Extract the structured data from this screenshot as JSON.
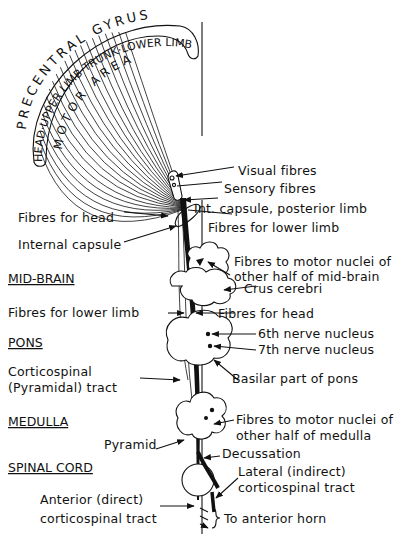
{
  "cortex": {
    "outer_label": "PRECENTRAL GYRUS",
    "band_label": "HEAD·UPPER LIMB·TRUNK·LOWER LIMB",
    "inner_label": "MOTOR AREA"
  },
  "sections": {
    "midbrain": "MID-BRAIN",
    "pons": "PONS",
    "medulla": "MEDULLA",
    "spinal_cord": "SPINAL CORD"
  },
  "labels_right": {
    "visual_fibres": "Visual fibres",
    "sensory_fibres": "Sensory fibres",
    "int_capsule_posterior": "Int. capsule, posterior limb",
    "fibres_lower_limb_top": "Fibres for lower limb",
    "motor_nuclei_midbrain_1": "Fibres to motor nuclei of",
    "motor_nuclei_midbrain_2": "other half of mid-brain",
    "crus_cerebri": "Crus cerebri",
    "fibres_head_right": "Fibres for head",
    "sixth_nerve": "6th nerve nucleus",
    "seventh_nerve": "7th nerve nucleus",
    "basilar_pons": "Basilar part of pons",
    "motor_nuclei_medulla_1": "Fibres to motor nuclei of",
    "motor_nuclei_medulla_2": "other half of medulla",
    "decussation": "Decussation",
    "lateral_tract_1": "Lateral (indirect)",
    "lateral_tract_2": "corticospinal tract",
    "anterior_horn": "To anterior horn"
  },
  "labels_left": {
    "fibres_head": "Fibres for head",
    "internal_capsule": "Internal capsule",
    "fibres_lower_limb": "Fibres for lower limb",
    "corticospinal_1": "Corticospinal",
    "corticospinal_2": "(Pyramidal) tract",
    "pyramid": "Pyramid",
    "anterior_tract_1": "Anterior (direct)",
    "anterior_tract_2": "corticospinal tract"
  }
}
